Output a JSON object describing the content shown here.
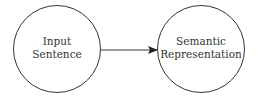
{
  "diagram": {
    "nodes": [
      {
        "id": "input",
        "lines": [
          "Input",
          "Sentence"
        ]
      },
      {
        "id": "semantic",
        "lines": [
          "Semantic",
          "Representation"
        ]
      }
    ],
    "edges": [
      {
        "from": "input",
        "to": "semantic",
        "label": ""
      }
    ],
    "colors": {
      "stroke": "#333333",
      "background": "#ffffff"
    }
  }
}
